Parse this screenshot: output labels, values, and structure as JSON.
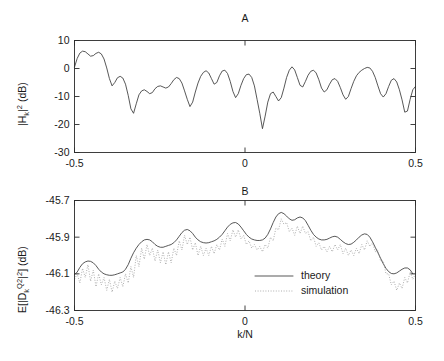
{
  "figure": {
    "width": 444,
    "height": 361,
    "background": "#ffffff",
    "line_color_theory": "#3a3a3a",
    "line_color_simulation": "#9a9a9a",
    "axis_color": "#2b2b2b"
  },
  "panel_a": {
    "title": "A",
    "ylabel_main": "|H",
    "ylabel_sub": "k",
    "ylabel_sup": "2",
    "ylabel_tail": " (dB)",
    "ylabel_full": "|H_k|^2 (dB)",
    "xticklabels": [
      "-0.5",
      "0",
      "0.5"
    ],
    "yticklabels": [
      "10",
      "0",
      "-10",
      "-20",
      "-30"
    ]
  },
  "panel_b": {
    "title": "B",
    "ylabel_prefix": "E[|D",
    "ylabel_sub": "k",
    "ylabel_sup": "Q2",
    "ylabel_mid": "|",
    "ylabel_sup2": "2",
    "ylabel_close": "] (dB)",
    "ylabel_full": "E[|D_k^{Q2}|^2] (dB)",
    "xlabel": "k/N",
    "xticklabels": [
      "-0.5",
      "0",
      "0.5"
    ],
    "yticklabels": [
      "-45.7",
      "-45.9",
      "-46.1",
      "-46.3"
    ],
    "legend": [
      {
        "label": "theory",
        "style": "solid"
      },
      {
        "label": "simulation",
        "style": "dotted"
      }
    ]
  },
  "chart_data": [
    {
      "type": "line",
      "panel": "A",
      "title": "A",
      "xlabel": "",
      "ylabel": "|H_k|^2 (dB)",
      "xlim": [
        -0.5,
        0.5
      ],
      "ylim": [
        -30,
        10
      ],
      "xticks": [
        -0.5,
        0,
        0.5
      ],
      "yticks": [
        10,
        0,
        -10,
        -20,
        -30
      ],
      "grid": false,
      "legend_position": "none",
      "series": [
        {
          "name": "channel magnitude response",
          "style": "solid",
          "color": "#3a3a3a",
          "x": [
            -0.5,
            -0.4921,
            -0.4843,
            -0.4764,
            -0.4685,
            -0.4606,
            -0.4528,
            -0.4449,
            -0.437,
            -0.4291,
            -0.4213,
            -0.4134,
            -0.4055,
            -0.3976,
            -0.3898,
            -0.3819,
            -0.374,
            -0.3661,
            -0.3583,
            -0.3504,
            -0.3425,
            -0.3346,
            -0.3268,
            -0.3189,
            -0.311,
            -0.3031,
            -0.2953,
            -0.2874,
            -0.2795,
            -0.2717,
            -0.2638,
            -0.2559,
            -0.248,
            -0.2402,
            -0.2323,
            -0.2244,
            -0.2165,
            -0.2087,
            -0.2008,
            -0.1929,
            -0.185,
            -0.1772,
            -0.1693,
            -0.1614,
            -0.1535,
            -0.1457,
            -0.1378,
            -0.1299,
            -0.122,
            -0.1142,
            -0.1063,
            -0.0984,
            -0.0906,
            -0.0827,
            -0.0748,
            -0.0669,
            -0.0591,
            -0.0512,
            -0.0433,
            -0.0354,
            -0.0276,
            -0.0197,
            -0.0118,
            -0.0039,
            0.0039,
            0.0118,
            0.0197,
            0.0276,
            0.0354,
            0.0433,
            0.0512,
            0.0591,
            0.0669,
            0.0748,
            0.0827,
            0.0906,
            0.0984,
            0.1063,
            0.1142,
            0.122,
            0.1299,
            0.1378,
            0.1457,
            0.1535,
            0.1614,
            0.1693,
            0.1772,
            0.185,
            0.1929,
            0.2008,
            0.2087,
            0.2165,
            0.2244,
            0.2323,
            0.2402,
            0.248,
            0.2559,
            0.2638,
            0.2717,
            0.2795,
            0.2874,
            0.2953,
            0.3031,
            0.311,
            0.3189,
            0.3268,
            0.3346,
            0.3425,
            0.3504,
            0.3583,
            0.3661,
            0.374,
            0.3819,
            0.3898,
            0.3976,
            0.4055,
            0.4134,
            0.4213,
            0.4291,
            0.437,
            0.4449,
            0.4528,
            0.4606,
            0.4685,
            0.4764,
            0.4843,
            0.4921,
            0.5
          ],
          "y": [
            0.5,
            3.6,
            5.5,
            6.2,
            6.0,
            5.2,
            4.4,
            4.6,
            5.4,
            5.8,
            5.2,
            3.4,
            0.2,
            -3.6,
            -6.2,
            -5.0,
            -3.3,
            -2.8,
            -3.4,
            -5.6,
            -9.6,
            -14.4,
            -16.0,
            -12.6,
            -9.4,
            -8.0,
            -7.6,
            -8.2,
            -9.0,
            -8.6,
            -7.2,
            -6.4,
            -6.2,
            -6.6,
            -7.0,
            -6.6,
            -5.4,
            -4.0,
            -3.2,
            -3.6,
            -5.2,
            -8.0,
            -11.0,
            -13.6,
            -12.0,
            -8.4,
            -5.2,
            -2.8,
            -1.4,
            -0.8,
            -1.6,
            -3.6,
            -5.6,
            -5.0,
            -2.6,
            -0.9,
            -0.6,
            -1.8,
            -4.6,
            -8.2,
            -10.4,
            -9.0,
            -6.0,
            -3.6,
            -2.2,
            -2.0,
            -3.2,
            -6.2,
            -11.0,
            -16.0,
            -21.5,
            -17.0,
            -12.0,
            -9.0,
            -8.4,
            -10.0,
            -11.6,
            -10.4,
            -7.0,
            -3.2,
            -0.6,
            0.6,
            -0.5,
            -3.2,
            -6.0,
            -6.6,
            -4.6,
            -2.4,
            -1.0,
            -0.6,
            -1.6,
            -4.0,
            -7.0,
            -8.4,
            -7.6,
            -5.6,
            -4.0,
            -3.6,
            -4.6,
            -6.8,
            -9.4,
            -11.0,
            -10.0,
            -7.2,
            -4.6,
            -2.6,
            -1.4,
            -0.6,
            0.0,
            0.4,
            0.2,
            -1.0,
            -3.2,
            -6.2,
            -9.0,
            -10.2,
            -9.0,
            -6.4,
            -4.2,
            -3.6,
            -4.8,
            -7.6,
            -11.2,
            -15.6,
            -15.2,
            -11.0,
            -7.6,
            -6.4
          ]
        }
      ]
    },
    {
      "type": "line",
      "panel": "B",
      "title": "B",
      "xlabel": "k/N",
      "ylabel": "E[|D_k^{Q2}|^2] (dB)",
      "xlim": [
        -0.5,
        0.5
      ],
      "ylim": [
        -46.3,
        -45.7
      ],
      "xticks": [
        -0.5,
        0,
        0.5
      ],
      "yticks": [
        -45.7,
        -45.9,
        -46.1,
        -46.3
      ],
      "grid": false,
      "legend_position": "lower-center-right",
      "series": [
        {
          "name": "theory",
          "style": "solid",
          "color": "#3a3a3a",
          "x": [
            -0.5,
            -0.4921,
            -0.4843,
            -0.4764,
            -0.4685,
            -0.4606,
            -0.4528,
            -0.4449,
            -0.437,
            -0.4291,
            -0.4213,
            -0.4134,
            -0.4055,
            -0.3976,
            -0.3898,
            -0.3819,
            -0.374,
            -0.3661,
            -0.3583,
            -0.3504,
            -0.3425,
            -0.3346,
            -0.3268,
            -0.3189,
            -0.311,
            -0.3031,
            -0.2953,
            -0.2874,
            -0.2795,
            -0.2717,
            -0.2638,
            -0.2559,
            -0.248,
            -0.2402,
            -0.2323,
            -0.2244,
            -0.2165,
            -0.2087,
            -0.2008,
            -0.1929,
            -0.185,
            -0.1772,
            -0.1693,
            -0.1614,
            -0.1535,
            -0.1457,
            -0.1378,
            -0.1299,
            -0.122,
            -0.1142,
            -0.1063,
            -0.0984,
            -0.0906,
            -0.0827,
            -0.0748,
            -0.0669,
            -0.0591,
            -0.0512,
            -0.0433,
            -0.0354,
            -0.0276,
            -0.0197,
            -0.0118,
            -0.0039,
            0.0039,
            0.0118,
            0.0197,
            0.0276,
            0.0354,
            0.0433,
            0.0512,
            0.0591,
            0.0669,
            0.0748,
            0.0827,
            0.0906,
            0.0984,
            0.1063,
            0.1142,
            0.122,
            0.1299,
            0.1378,
            0.1457,
            0.1535,
            0.1614,
            0.1693,
            0.1772,
            0.185,
            0.1929,
            0.2008,
            0.2087,
            0.2165,
            0.2244,
            0.2323,
            0.2402,
            0.248,
            0.2559,
            0.2638,
            0.2717,
            0.2795,
            0.2874,
            0.2953,
            0.3031,
            0.311,
            0.3189,
            0.3268,
            0.3346,
            0.3425,
            0.3504,
            0.3583,
            0.3661,
            0.374,
            0.3819,
            0.3898,
            0.3976,
            0.4055,
            0.4134,
            0.4213,
            0.4291,
            0.437,
            0.4449,
            0.4528,
            0.4606,
            0.4685,
            0.4764,
            0.4843,
            0.4921,
            0.5
          ],
          "y": [
            -46.105,
            -46.09,
            -46.065,
            -46.045,
            -46.035,
            -46.03,
            -46.032,
            -46.04,
            -46.055,
            -46.075,
            -46.09,
            -46.1,
            -46.105,
            -46.108,
            -46.108,
            -46.105,
            -46.1,
            -46.095,
            -46.09,
            -46.075,
            -46.05,
            -46.015,
            -45.985,
            -45.96,
            -45.94,
            -45.925,
            -45.915,
            -45.912,
            -45.915,
            -45.925,
            -45.94,
            -45.95,
            -45.955,
            -45.955,
            -45.95,
            -45.945,
            -45.94,
            -45.93,
            -45.915,
            -45.895,
            -45.875,
            -45.862,
            -45.858,
            -45.865,
            -45.88,
            -45.9,
            -45.915,
            -45.925,
            -45.93,
            -45.932,
            -45.93,
            -45.925,
            -45.92,
            -45.912,
            -45.9,
            -45.885,
            -45.865,
            -45.845,
            -45.83,
            -45.822,
            -45.82,
            -45.828,
            -45.845,
            -45.865,
            -45.885,
            -45.9,
            -45.91,
            -45.915,
            -45.918,
            -45.918,
            -45.915,
            -45.905,
            -45.885,
            -45.855,
            -45.82,
            -45.79,
            -45.772,
            -45.765,
            -45.772,
            -45.785,
            -45.8,
            -45.808,
            -45.805,
            -45.795,
            -45.79,
            -45.795,
            -45.81,
            -45.835,
            -45.862,
            -45.885,
            -45.9,
            -45.91,
            -45.915,
            -45.915,
            -45.912,
            -45.905,
            -45.898,
            -45.895,
            -45.9,
            -45.912,
            -45.925,
            -45.935,
            -45.94,
            -45.938,
            -45.928,
            -45.915,
            -45.9,
            -45.888,
            -45.882,
            -45.885,
            -45.9,
            -45.925,
            -45.955,
            -45.985,
            -46.015,
            -46.045,
            -46.07,
            -46.088,
            -46.098,
            -46.1,
            -46.095,
            -46.085,
            -46.075,
            -46.068,
            -46.068,
            -46.078,
            -46.1
          ]
        },
        {
          "name": "simulation",
          "style": "dotted",
          "color": "#9a9a9a",
          "x": [
            -0.5,
            -0.4921,
            -0.4843,
            -0.4764,
            -0.4685,
            -0.4606,
            -0.4528,
            -0.4449,
            -0.437,
            -0.4291,
            -0.4213,
            -0.4134,
            -0.4055,
            -0.3976,
            -0.3898,
            -0.3819,
            -0.374,
            -0.3661,
            -0.3583,
            -0.3504,
            -0.3425,
            -0.3346,
            -0.3268,
            -0.3189,
            -0.311,
            -0.3031,
            -0.2953,
            -0.2874,
            -0.2795,
            -0.2717,
            -0.2638,
            -0.2559,
            -0.248,
            -0.2402,
            -0.2323,
            -0.2244,
            -0.2165,
            -0.2087,
            -0.2008,
            -0.1929,
            -0.185,
            -0.1772,
            -0.1693,
            -0.1614,
            -0.1535,
            -0.1457,
            -0.1378,
            -0.1299,
            -0.122,
            -0.1142,
            -0.1063,
            -0.0984,
            -0.0906,
            -0.0827,
            -0.0748,
            -0.0669,
            -0.0591,
            -0.0512,
            -0.0433,
            -0.0354,
            -0.0276,
            -0.0197,
            -0.0118,
            -0.0039,
            0.0039,
            0.0118,
            0.0197,
            0.0276,
            0.0354,
            0.0433,
            0.0512,
            0.0591,
            0.0669,
            0.0748,
            0.0827,
            0.0906,
            0.0984,
            0.1063,
            0.1142,
            0.122,
            0.1299,
            0.1378,
            0.1457,
            0.1535,
            0.1614,
            0.1693,
            0.1772,
            0.185,
            0.1929,
            0.2008,
            0.2087,
            0.2165,
            0.2244,
            0.2323,
            0.2402,
            0.248,
            0.2559,
            0.2638,
            0.2717,
            0.2795,
            0.2874,
            0.2953,
            0.3031,
            0.311,
            0.3189,
            0.3268,
            0.3346,
            0.3425,
            0.3504,
            0.3583,
            0.3661,
            0.374,
            0.3819,
            0.3898,
            0.3976,
            0.4055,
            0.4134,
            0.4213,
            0.4291,
            0.437,
            0.4449,
            0.4528,
            0.4606,
            0.4685,
            0.4764,
            0.4843,
            0.4921,
            0.5
          ],
          "y": [
            -46.13,
            -46.1,
            -46.15,
            -46.07,
            -46.12,
            -46.05,
            -46.14,
            -46.08,
            -46.17,
            -46.1,
            -46.16,
            -46.12,
            -46.19,
            -46.13,
            -46.2,
            -46.14,
            -46.18,
            -46.12,
            -46.17,
            -46.1,
            -46.15,
            -46.06,
            -46.12,
            -46.0,
            -46.06,
            -45.96,
            -46.02,
            -45.94,
            -46.0,
            -45.96,
            -46.03,
            -45.97,
            -46.04,
            -45.98,
            -46.05,
            -45.98,
            -46.04,
            -45.96,
            -46.0,
            -45.92,
            -45.97,
            -45.89,
            -45.94,
            -45.9,
            -45.97,
            -45.93,
            -46.0,
            -45.95,
            -46.0,
            -45.96,
            -46.0,
            -45.95,
            -45.99,
            -45.94,
            -45.97,
            -45.91,
            -45.95,
            -45.88,
            -45.92,
            -45.86,
            -45.9,
            -45.86,
            -45.91,
            -45.89,
            -45.94,
            -45.92,
            -45.96,
            -45.94,
            -45.97,
            -45.95,
            -45.98,
            -45.94,
            -45.96,
            -45.9,
            -45.92,
            -45.85,
            -45.86,
            -45.8,
            -45.83,
            -45.82,
            -45.87,
            -45.85,
            -45.89,
            -45.84,
            -45.88,
            -45.84,
            -45.88,
            -45.87,
            -45.92,
            -45.9,
            -45.95,
            -45.93,
            -45.97,
            -45.95,
            -45.98,
            -45.95,
            -45.98,
            -45.94,
            -45.97,
            -45.94,
            -45.99,
            -45.96,
            -46.0,
            -45.97,
            -46.0,
            -45.96,
            -45.99,
            -45.94,
            -45.97,
            -45.92,
            -45.95,
            -45.93,
            -45.98,
            -45.97,
            -46.03,
            -46.03,
            -46.1,
            -46.1,
            -46.16,
            -46.14,
            -46.19,
            -46.15,
            -46.18,
            -46.12,
            -46.15,
            -46.09,
            -46.13,
            -46.1,
            -46.17
          ]
        }
      ]
    }
  ]
}
